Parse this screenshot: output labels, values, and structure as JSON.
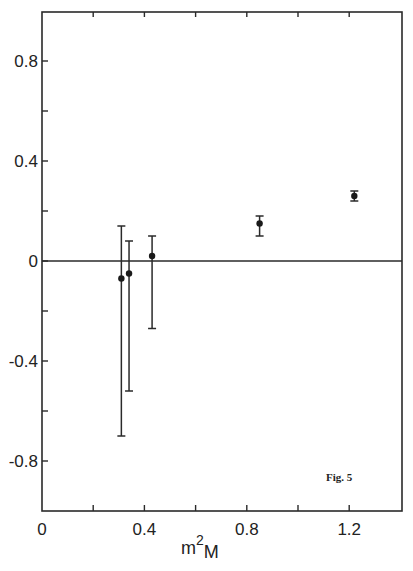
{
  "chart_data": {
    "type": "scatter",
    "title": "",
    "annotation": "Fig. 5",
    "xlabel": "m",
    "xlabel_superscript": "2",
    "xlabel_subscript": "M",
    "ylabel": "",
    "xlim": [
      0,
      1.4
    ],
    "ylim": [
      -1.0,
      1.0
    ],
    "grid": false,
    "legend": null,
    "x_ticks": [
      0,
      0.2,
      0.4,
      0.6,
      0.8,
      1.0,
      1.2
    ],
    "x_tick_labels": [
      "0",
      "",
      "0.4",
      "",
      "0.8",
      "",
      "1.2"
    ],
    "y_ticks": [
      -0.8,
      -0.6,
      -0.4,
      -0.2,
      0,
      0.2,
      0.4,
      0.6,
      0.8
    ],
    "y_tick_labels": [
      "-0.8",
      "",
      "-0.4",
      "",
      "0",
      "",
      "0.4",
      "",
      "0.8"
    ],
    "reference_line": {
      "y": 0
    },
    "series": [
      {
        "name": "data",
        "points": [
          {
            "x": 0.31,
            "y": -0.07,
            "y_err_high": 0.14,
            "y_err_low": -0.7
          },
          {
            "x": 0.34,
            "y": -0.05,
            "y_err_high": 0.08,
            "y_err_low": -0.52
          },
          {
            "x": 0.43,
            "y": 0.02,
            "y_err_high": 0.1,
            "y_err_low": -0.27
          },
          {
            "x": 0.85,
            "y": 0.15,
            "y_err_high": 0.18,
            "y_err_low": 0.1
          },
          {
            "x": 1.22,
            "y": 0.26,
            "y_err_high": 0.28,
            "y_err_low": 0.24
          }
        ]
      }
    ]
  }
}
